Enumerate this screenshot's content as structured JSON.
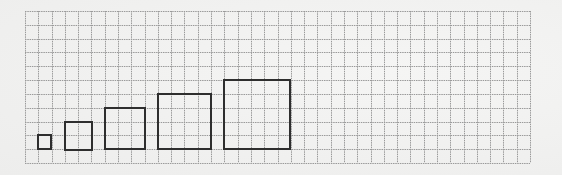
{
  "diagram": {
    "grid": {
      "columns": 38,
      "rows": 11,
      "line_color": "#9a9a9a",
      "background_color": "#f1f1f0"
    },
    "squares": [
      {
        "id": 1,
        "side_units": 1,
        "col": 1,
        "row": 9
      },
      {
        "id": 2,
        "side_units": 2,
        "col": 3,
        "row": 8
      },
      {
        "id": 3,
        "side_units": 3,
        "col": 6,
        "row": 7
      },
      {
        "id": 4,
        "side_units": 4,
        "col": 10,
        "row": 6
      },
      {
        "id": 5,
        "side_units": 5,
        "col": 15,
        "row": 5
      }
    ],
    "square_stroke_color": "#2e2e2e"
  }
}
